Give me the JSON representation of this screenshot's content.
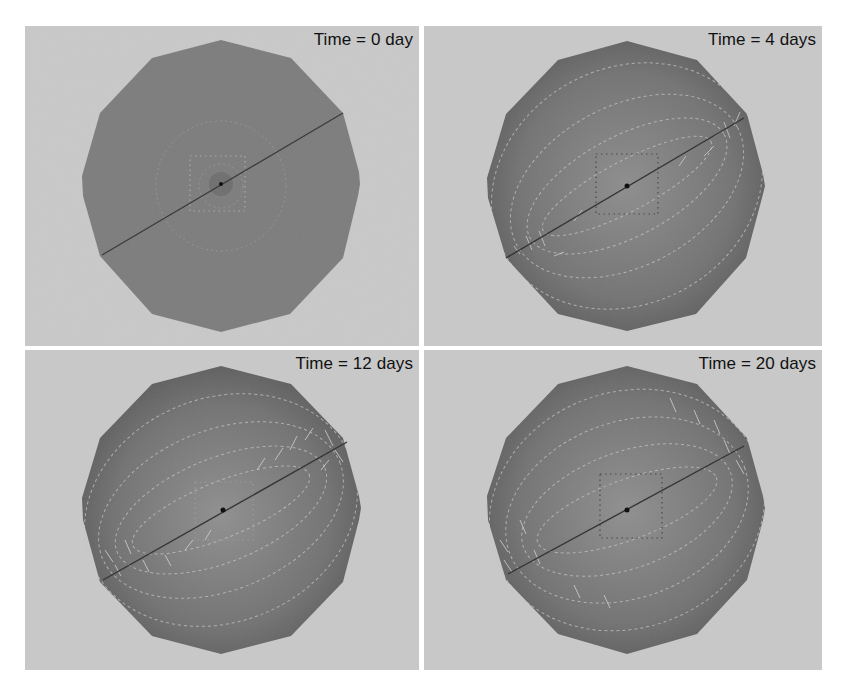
{
  "figure": {
    "layout": "2x2 grid",
    "background_color": "#c9c9c9",
    "shape_color_initial": "#7a7a7a",
    "shape_color_edge": "#5e5e5e",
    "shape_color_center": "#8e8e8e",
    "panels": [
      {
        "label": "Time = 0 day",
        "time_days": 0,
        "deformed": false
      },
      {
        "label": "Time = 4 days",
        "time_days": 4,
        "deformed": true
      },
      {
        "label": "Time = 12 days",
        "time_days": 12,
        "deformed": true
      },
      {
        "label": "Time = 20 days",
        "time_days": 20,
        "deformed": true
      }
    ]
  }
}
